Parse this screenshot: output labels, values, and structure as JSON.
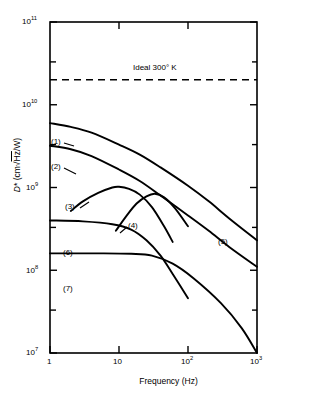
{
  "chart_data": {
    "type": "line",
    "title": "",
    "xlabel": "Frequency  (Hz)",
    "ylabel": "D* (cm√Hz/W)",
    "xscale": "log",
    "yscale": "log",
    "xlim": [
      1,
      1000
    ],
    "ylim": [
      10000000,
      100000000000
    ],
    "grid": false,
    "legend_position": "inline-curve-labels",
    "xticks": [
      1,
      10,
      100,
      1000
    ],
    "xtick_labels": [
      "1",
      "10",
      "10²",
      "10³"
    ],
    "yticks": [
      10000000,
      100000000,
      1000000000,
      10000000000,
      100000000000
    ],
    "ytick_labels": [
      "10⁷",
      "10⁸",
      "10⁹",
      "10¹⁰",
      "10¹¹"
    ],
    "y_minor_ticks": [
      300000000,
      3000000000,
      30000000000
    ],
    "annotations": [
      {
        "name": "ideal-300k-line",
        "label": "Ideal  300° K",
        "value": 20000000000,
        "style": "dashed-horizontal"
      }
    ],
    "series": [
      {
        "name": "(1)",
        "label": "(1)",
        "points": [
          [
            1,
            6000000000.0
          ],
          [
            2,
            5400000000.0
          ],
          [
            4,
            4600000000.0
          ],
          [
            10,
            3300000000.0
          ],
          [
            20,
            2500000000.0
          ],
          [
            40,
            1750000000.0
          ],
          [
            100,
            1050000000.0
          ],
          [
            200,
            680000000.0
          ],
          [
            400,
            420000000.0
          ],
          [
            1000,
            230000000.0
          ]
        ]
      },
      {
        "name": "(2)",
        "label": "(2)",
        "points": [
          [
            1,
            3200000000.0
          ],
          [
            2,
            2900000000.0
          ],
          [
            4,
            2400000000.0
          ],
          [
            10,
            1650000000.0
          ],
          [
            20,
            1200000000.0
          ],
          [
            40,
            800000000.0
          ],
          [
            100,
            460000000.0
          ],
          [
            200,
            300000000.0
          ],
          [
            400,
            190000000.0
          ],
          [
            1000,
            110000000.0
          ]
        ]
      },
      {
        "name": "(3)",
        "label": "(3)",
        "points": [
          [
            2.0,
            520000000.0
          ],
          [
            3,
            680000000.0
          ],
          [
            5,
            860000000.0
          ],
          [
            8,
            1000000000.0
          ],
          [
            10,
            1020000000.0
          ],
          [
            14,
            960000000.0
          ],
          [
            20,
            820000000.0
          ],
          [
            30,
            580000000.0
          ],
          [
            45,
            340000000.0
          ],
          [
            60,
            220000000.0
          ]
        ]
      },
      {
        "name": "(4)",
        "label": "(4)",
        "points": [
          [
            9,
            300000000.0
          ],
          [
            13,
            460000000.0
          ],
          [
            18,
            640000000.0
          ],
          [
            25,
            780000000.0
          ],
          [
            33,
            840000000.0
          ],
          [
            45,
            760000000.0
          ],
          [
            65,
            560000000.0
          ],
          [
            100,
            340000000.0
          ]
        ]
      },
      {
        "name": "(5)",
        "label": "(5)",
        "points": [
          [
            1,
            3200000000.0
          ],
          [
            2,
            2900000000.0
          ],
          [
            4,
            2400000000.0
          ],
          [
            10,
            1650000000.0
          ],
          [
            20,
            1200000000.0
          ],
          [
            40,
            800000000.0
          ],
          [
            100,
            460000000.0
          ],
          [
            200,
            300000000.0
          ],
          [
            400,
            190000000.0
          ],
          [
            1000,
            110000000.0
          ]
        ]
      },
      {
        "name": "(6)",
        "label": "(6)",
        "points": [
          [
            1,
            400000000.0
          ],
          [
            3,
            390000000.0
          ],
          [
            8,
            360000000.0
          ],
          [
            15,
            310000000.0
          ],
          [
            25,
            230000000.0
          ],
          [
            40,
            150000000.0
          ],
          [
            60,
            90000000.0
          ],
          [
            100,
            46000000.0
          ]
        ]
      },
      {
        "name": "(7)",
        "label": "(7)",
        "points": [
          [
            1,
            160000000.0
          ],
          [
            5,
            160000000.0
          ],
          [
            15,
            158000000.0
          ],
          [
            30,
            150000000.0
          ],
          [
            60,
            120000000.0
          ],
          [
            120,
            80000000.0
          ],
          [
            300,
            40000000.0
          ],
          [
            600,
            20000000.0
          ],
          [
            1000,
            10000000.0
          ]
        ]
      }
    ]
  },
  "axes": {
    "x_title": "Frequency  (Hz)",
    "y_title": "D* (cm√Hz/W)"
  },
  "ideal_line": {
    "label": "Ideal  300° K"
  },
  "tick_labels": {
    "y": [
      "10¹¹",
      "10¹⁰",
      "10⁹",
      "10⁸",
      "10⁷"
    ],
    "x": [
      "1",
      "10",
      "10²",
      "10³"
    ]
  },
  "curve_labels": {
    "c1": "(1)",
    "c2": "(2)",
    "c3": "(3)",
    "c4": "(4)",
    "c5": "(5)",
    "c6": "(6)",
    "c7": "(7)"
  },
  "colors": {
    "line": "#000000",
    "background": "#ffffff",
    "axis": "#000000"
  }
}
